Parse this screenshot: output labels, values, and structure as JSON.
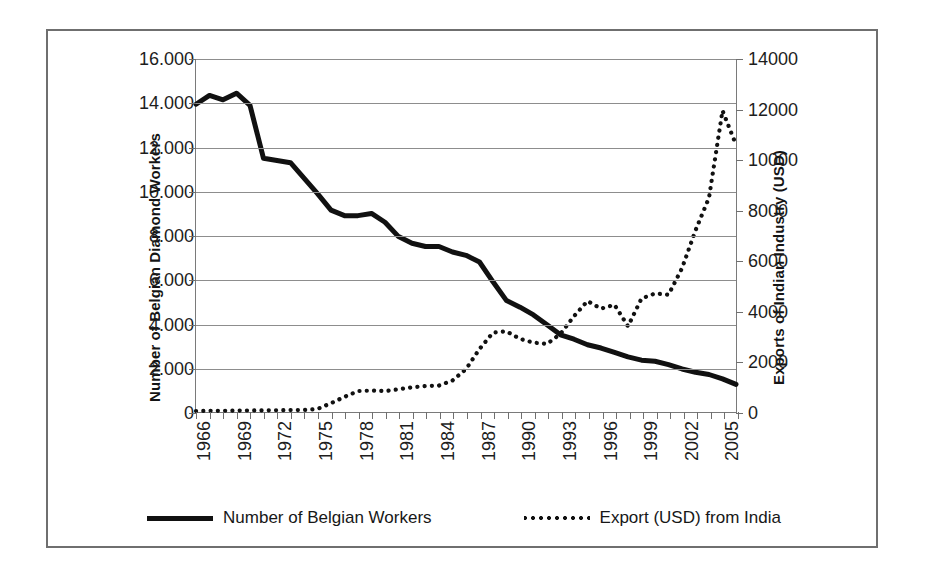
{
  "chart_data": {
    "type": "line",
    "title": "",
    "xlabel": "",
    "grid": "horizontal",
    "legend_position": "bottom",
    "x": [
      1966,
      1967,
      1968,
      1969,
      1970,
      1971,
      1972,
      1973,
      1974,
      1975,
      1976,
      1977,
      1978,
      1979,
      1980,
      1981,
      1982,
      1983,
      1984,
      1985,
      1986,
      1987,
      1988,
      1989,
      1990,
      1991,
      1992,
      1993,
      1994,
      1995,
      1996,
      1997,
      1998,
      1999,
      2000,
      2001,
      2002,
      2003,
      2004,
      2005,
      2006
    ],
    "xtick_labels": [
      "1966",
      "1969",
      "1972",
      "1975",
      "1978",
      "1981",
      "1984",
      "1987",
      "1990",
      "1993",
      "1996",
      "1999",
      "2002",
      "2005"
    ],
    "xtick_years": [
      1966,
      1969,
      1972,
      1975,
      1978,
      1981,
      1984,
      1987,
      1990,
      1993,
      1996,
      1999,
      2002,
      2005
    ],
    "axes": {
      "left": {
        "label": "Number of Belgian Diamond Workers",
        "ticks": [
          0,
          2000,
          4000,
          6000,
          8000,
          10000,
          12000,
          14000,
          16000
        ],
        "tick_labels": [
          "0",
          "2.000",
          "4.000",
          "6.000",
          "8.000",
          "10.000",
          "12.000",
          "14.000",
          "16.000"
        ],
        "ylim": [
          0,
          16000
        ]
      },
      "right": {
        "label": "Exports of Indian Industry (USD)",
        "ticks": [
          0,
          2000,
          4000,
          6000,
          8000,
          10000,
          12000,
          14000
        ],
        "tick_labels": [
          "0",
          "2000",
          "4000",
          "6000",
          "8000",
          "10000",
          "12000",
          "14000"
        ],
        "ylim": [
          0,
          14000
        ]
      }
    },
    "series": [
      {
        "name": "Number of Belgian Workers",
        "axis": "left",
        "style": "solid",
        "color": "#111111",
        "values": [
          13950,
          14350,
          14150,
          14450,
          13900,
          11500,
          11400,
          11300,
          10600,
          9900,
          9150,
          8900,
          8900,
          9000,
          8600,
          7950,
          7650,
          7500,
          7500,
          7250,
          7100,
          6800,
          5900,
          5050,
          4750,
          4400,
          3950,
          3500,
          3300,
          3050,
          2900,
          2700,
          2500,
          2350,
          2300,
          2150,
          1950,
          1800,
          1700,
          1500,
          1250
        ]
      },
      {
        "name": "Export (USD) from India",
        "axis": "right",
        "style": "dotted",
        "color": "#111111",
        "values": [
          40,
          45,
          50,
          55,
          60,
          65,
          70,
          75,
          80,
          120,
          350,
          600,
          830,
          850,
          830,
          900,
          980,
          1030,
          1050,
          1250,
          1700,
          2500,
          3150,
          3200,
          2900,
          2750,
          2700,
          3100,
          3800,
          4400,
          4100,
          4250,
          3400,
          4500,
          4700,
          4650,
          5700,
          7200,
          8500,
          11950,
          10600
        ]
      }
    ],
    "legend": [
      {
        "label": "Number of Belgian Workers",
        "style": "solid"
      },
      {
        "label": "Export (USD) from India",
        "style": "dotted"
      }
    ]
  }
}
